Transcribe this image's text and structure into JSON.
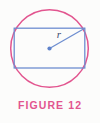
{
  "figure": {
    "caption": "FIGURE 12",
    "radius_label": "r",
    "colors": {
      "circle_stroke": "#e2558f",
      "rectangle_stroke": "#6e8ed0",
      "radius_line": "#6e8ed0",
      "center_dot": "#5f83cb",
      "caption_text": "#e2558f",
      "label_text": "#3c4a6e",
      "background": "#fcfcfb"
    },
    "geometry": {
      "circle": {
        "cx": 49.5,
        "cy": 48.5,
        "r": 38.8
      },
      "rectangle": {
        "x": 14.2,
        "y": 28.2,
        "width": 70.6,
        "height": 39.8
      },
      "center_point": {
        "x": 49.5,
        "y": 48.5
      },
      "radius_endpoint": {
        "x": 84.8,
        "y": 28.2
      }
    },
    "radius_label_position": {
      "x": 59,
      "y": 38
    }
  }
}
